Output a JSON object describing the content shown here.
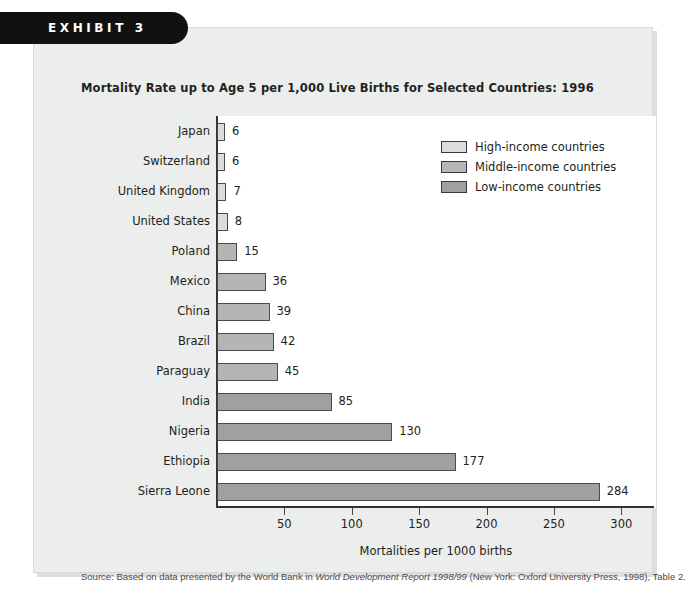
{
  "exhibit": {
    "banner_label": "EXHIBIT 3",
    "title": "Mortality Rate up to Age 5 per 1,000 Live Births for Selected Countries: 1996"
  },
  "source": {
    "prefix": "Source: Based on data presented by the World Bank in ",
    "italic_part": "World Development Report 1998/99",
    "suffix": " (New York: Oxford University Press, 1998), Table 2."
  },
  "legend": {
    "items": [
      {
        "label": "High-income countries",
        "color": "#dcdcdc"
      },
      {
        "label": "Middle-income countries",
        "color": "#b5b5b5"
      },
      {
        "label": "Low-income countries",
        "color": "#a0a0a0"
      }
    ]
  },
  "chart_data": {
    "type": "bar",
    "orientation": "horizontal",
    "title": "Mortality Rate up to Age 5 per 1,000 Live Births for Selected Countries: 1996",
    "xlabel": "Mortalities per 1000 births",
    "ylabel": "",
    "xlim": [
      0,
      325
    ],
    "xticks": [
      50,
      100,
      150,
      200,
      250,
      300
    ],
    "grid": false,
    "legend_position": "top-right",
    "categories": [
      "Japan",
      "Switzerland",
      "United Kingdom",
      "United States",
      "Poland",
      "Mexico",
      "China",
      "Brazil",
      "Paraguay",
      "India",
      "Nigeria",
      "Ethiopia",
      "Sierra Leone"
    ],
    "values": [
      6,
      6,
      7,
      8,
      15,
      36,
      39,
      42,
      45,
      85,
      130,
      177,
      284
    ],
    "groups": [
      "High-income countries",
      "High-income countries",
      "High-income countries",
      "High-income countries",
      "Middle-income countries",
      "Middle-income countries",
      "Middle-income countries",
      "Middle-income countries",
      "Middle-income countries",
      "Low-income countries",
      "Low-income countries",
      "Low-income countries",
      "Low-income countries"
    ],
    "bars": [
      {
        "label": "Japan",
        "value": 6,
        "value_text": "6",
        "group": "High-income countries",
        "color": "#dcdcdc"
      },
      {
        "label": "Switzerland",
        "value": 6,
        "value_text": "6",
        "group": "High-income countries",
        "color": "#dcdcdc"
      },
      {
        "label": "United Kingdom",
        "value": 7,
        "value_text": "7",
        "group": "High-income countries",
        "color": "#dcdcdc"
      },
      {
        "label": "United States",
        "value": 8,
        "value_text": "8",
        "group": "High-income countries",
        "color": "#dcdcdc"
      },
      {
        "label": "Poland",
        "value": 15,
        "value_text": "15",
        "group": "Middle-income countries",
        "color": "#b5b5b5"
      },
      {
        "label": "Mexico",
        "value": 36,
        "value_text": "36",
        "group": "Middle-income countries",
        "color": "#b5b5b5"
      },
      {
        "label": "China",
        "value": 39,
        "value_text": "39",
        "group": "Middle-income countries",
        "color": "#b5b5b5"
      },
      {
        "label": "Brazil",
        "value": 42,
        "value_text": "42",
        "group": "Middle-income countries",
        "color": "#b5b5b5"
      },
      {
        "label": "Paraguay",
        "value": 45,
        "value_text": "45",
        "group": "Middle-income countries",
        "color": "#b5b5b5"
      },
      {
        "label": "India",
        "value": 85,
        "value_text": "85",
        "group": "Low-income countries",
        "color": "#a0a0a0"
      },
      {
        "label": "Nigeria",
        "value": 130,
        "value_text": "130",
        "group": "Low-income countries",
        "color": "#a0a0a0"
      },
      {
        "label": "Ethiopia",
        "value": 177,
        "value_text": "177",
        "group": "Low-income countries",
        "color": "#a0a0a0"
      },
      {
        "label": "Sierra Leone",
        "value": 284,
        "value_text": "284",
        "group": "Low-income countries",
        "color": "#a0a0a0"
      }
    ]
  }
}
